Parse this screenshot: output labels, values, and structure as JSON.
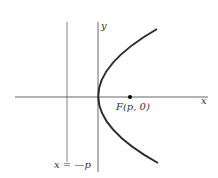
{
  "diagram": {
    "type": "parabola-focus-directrix",
    "labels": {
      "x_axis": "x",
      "y_axis": "y",
      "focus": "F(p, 0)",
      "directrix": "x = —p"
    },
    "colors": {
      "axis": "#555555",
      "curve": "#2b2b2b",
      "focus_point": "#000000",
      "text": "#333333"
    }
  }
}
